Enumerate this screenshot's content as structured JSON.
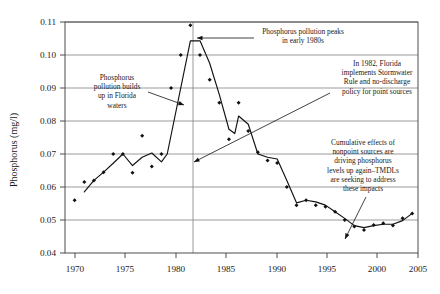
{
  "chart_data": {
    "type": "scatter",
    "title": "",
    "xlabel": "",
    "ylabel": "Phosphorus (mg/l)",
    "xlim": [
      1969,
      2005.6
    ],
    "ylim": [
      0.04,
      0.11
    ],
    "grid": true,
    "legend": "none",
    "xticks": [
      "1970",
      "1975",
      "1980",
      "1985",
      "1990",
      "1995",
      "2000",
      "2005"
    ],
    "xtick_values": [
      1970,
      1975,
      1980,
      1985,
      1990,
      1995,
      2000,
      2005
    ],
    "yticks": [
      "0.04",
      "0.05",
      "0.06",
      "0.07",
      "0.08",
      "0.09",
      "0.10",
      "0.11"
    ],
    "ytick_values": [
      0.04,
      0.05,
      0.06,
      0.07,
      0.08,
      0.09,
      0.1,
      0.11
    ],
    "reference_line_x": 1982,
    "series": [
      {
        "name": "Observed phosphorus",
        "type": "scatter",
        "x": [
          1970,
          1971,
          1972,
          1973,
          1974,
          1975,
          1976,
          1977,
          1978,
          1979,
          1980,
          1981,
          1982,
          1983,
          1984,
          1985,
          1986,
          1987,
          1988,
          1989,
          1990,
          1991,
          1992,
          1993,
          1994,
          1995,
          1996,
          1997,
          1998,
          1999,
          2000,
          2001,
          2002,
          2003,
          2004,
          2005
        ],
        "y": [
          0.056,
          0.0615,
          0.062,
          0.0645,
          0.07,
          0.07,
          0.0643,
          0.0755,
          0.0662,
          0.07,
          0.09,
          0.1,
          0.109,
          0.1,
          0.0925,
          0.0855,
          0.0745,
          0.0855,
          0.077,
          0.0705,
          0.068,
          0.0673,
          0.06,
          0.0545,
          0.056,
          0.0545,
          0.054,
          0.0525,
          0.05,
          0.048,
          0.047,
          0.0485,
          0.049,
          0.0483,
          0.0505,
          0.052
        ]
      },
      {
        "name": "Smoothed trend",
        "type": "line",
        "x": [
          1971,
          1972,
          1973,
          1974,
          1975,
          1976,
          1977,
          1978,
          1979,
          1979.6,
          1982,
          1983,
          1984,
          1985,
          1986,
          1986.6,
          1987,
          1988,
          1989,
          1990,
          1991,
          1992,
          1993,
          1994,
          1995,
          1996,
          1997,
          1998,
          1999,
          2000,
          2001,
          2002,
          2003,
          2004,
          2005
        ],
        "y": [
          0.0585,
          0.062,
          0.0645,
          0.0672,
          0.07,
          0.0665,
          0.069,
          0.0703,
          0.0676,
          0.07,
          0.1043,
          0.1043,
          0.0975,
          0.088,
          0.0775,
          0.0762,
          0.0815,
          0.079,
          0.07,
          0.069,
          0.0685,
          0.062,
          0.0552,
          0.056,
          0.0555,
          0.0545,
          0.0525,
          0.0505,
          0.0483,
          0.0477,
          0.0483,
          0.0487,
          0.0487,
          0.0498,
          0.052
        ]
      }
    ],
    "annotations": [
      {
        "id": "peak-annotation",
        "lines": [
          "Phosphorus pollution peaks",
          "in early 1980s"
        ],
        "text_x": 303,
        "text_y": 34,
        "arrow": {
          "x1": 254,
          "y1": 38,
          "x2": 197,
          "y2": 38
        }
      },
      {
        "id": "buildup-annotation",
        "lines": [
          "Phosphorus",
          "pollution builds",
          "up in Florida",
          "waters"
        ],
        "text_x": 117,
        "text_y": 80,
        "arrow": {
          "x1": 148,
          "y1": 92,
          "x2": 184,
          "y2": 105
        }
      },
      {
        "id": "stormwater-rule-annotation",
        "lines": [
          "In 1982, Florida",
          "implements Stormwater",
          "Rule and no-discharge",
          "policy for point sources"
        ],
        "text_x": 377,
        "text_y": 66,
        "arrow": {
          "x1": 330,
          "y1": 93,
          "x2": 194,
          "y2": 162
        }
      },
      {
        "id": "nonpoint-sources-annotation",
        "lines": [
          "Cumulative effects of",
          "nonpoint sources are",
          "driving phosphorus",
          "levels up again–TMDLs",
          "are seeking to address",
          "these impacts"
        ],
        "text_x": 363,
        "text_y": 145,
        "arrow": {
          "x1": 366,
          "y1": 197,
          "x2": 345,
          "y2": 239
        }
      }
    ]
  }
}
